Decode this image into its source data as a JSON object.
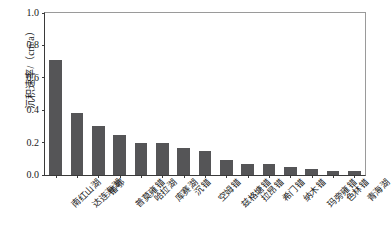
{
  "chart_data": {
    "type": "bar",
    "title": "",
    "subtitle": "",
    "xlabel": "",
    "ylabel": "沉积速率/（cm/a）",
    "ylim": [
      0.0,
      1.0
    ],
    "yticks": [
      "0.0",
      "0.2",
      "0.4",
      "0.6",
      "0.8",
      "1.0"
    ],
    "ytick_values": [
      0.0,
      0.2,
      0.4,
      0.6,
      0.8,
      1.0
    ],
    "grid": false,
    "legend": null,
    "legend_position": "none",
    "bar_color": "#555557",
    "axis_color": "#3a3a3a",
    "categories": [
      "南红山湖",
      "达连海湖",
      "错鄂",
      "普莫雍错",
      "哈拉湖",
      "库赛湖",
      "沉错",
      "空姆错",
      "兹格塘错",
      "拉昂错",
      "希门错",
      "纳木错",
      "玛旁雍错",
      "色林错",
      "青海湖"
    ],
    "values": [
      0.71,
      0.38,
      0.3,
      0.25,
      0.2,
      0.2,
      0.165,
      0.15,
      0.09,
      0.065,
      0.065,
      0.05,
      0.035,
      0.025,
      0.025
    ]
  }
}
